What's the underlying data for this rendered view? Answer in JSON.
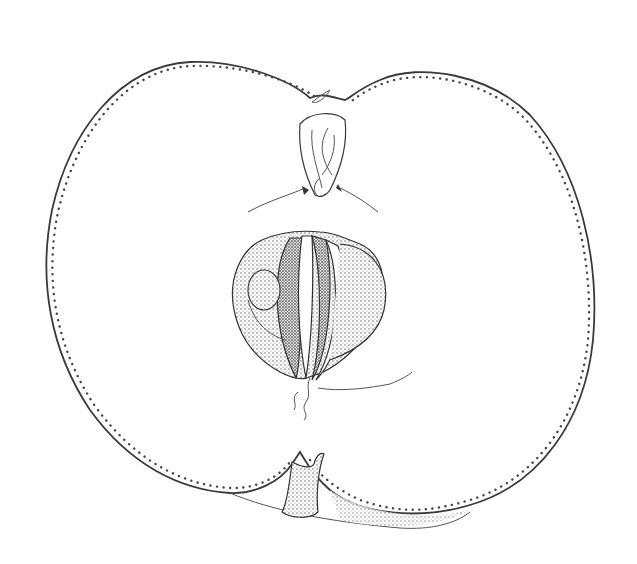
{
  "image": {
    "subject": "apple-longitudinal-section-illustration",
    "style": "pen-and-ink stipple botanical drawing",
    "colors": {
      "background": "#ffffff",
      "ink": "#3a3a3a",
      "stipple": "#555555"
    },
    "parts": [
      "skin-outline",
      "calyx",
      "core",
      "seed-chambers",
      "stalk-cavity",
      "stalk"
    ]
  }
}
